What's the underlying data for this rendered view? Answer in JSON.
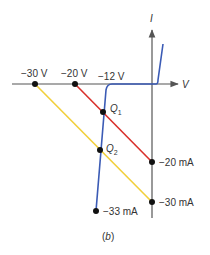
{
  "diagram": {
    "caption": "(b)",
    "caption_letter": "b",
    "axes": {
      "x_label": "V",
      "y_label": "I"
    },
    "voltage_labels": [
      "−30 V",
      "−20 V",
      "−12 V"
    ],
    "current_labels": [
      "−20 mA",
      "−30 mA",
      "−33 mA"
    ],
    "points": {
      "q1": {
        "label": "Q",
        "sub": "1"
      },
      "q2": {
        "label": "Q",
        "sub": "2"
      }
    },
    "colors": {
      "axis": "#555555",
      "diode_curve": "#3b5bb5",
      "load_line_20v": "#d9302b",
      "load_line_30v": "#f2cf3a",
      "dot": "#111111"
    }
  }
}
